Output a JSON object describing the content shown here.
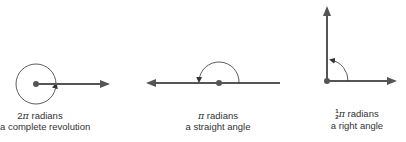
{
  "diagrams": [
    {
      "id": "full-revolution",
      "angle_coefficient": "2",
      "pi_symbol": "π",
      "unit": "radians",
      "description": "a complete revolution"
    },
    {
      "id": "straight-angle",
      "pi_symbol": "π",
      "unit": "radians",
      "description": "a straight angle"
    },
    {
      "id": "right-angle",
      "frac_num": "1",
      "frac_den": "2",
      "pi_symbol": "π",
      "unit": "radians",
      "description": "a right angle"
    }
  ],
  "colors": {
    "line": "#555555",
    "arc": "#333333",
    "text": "#333333"
  }
}
